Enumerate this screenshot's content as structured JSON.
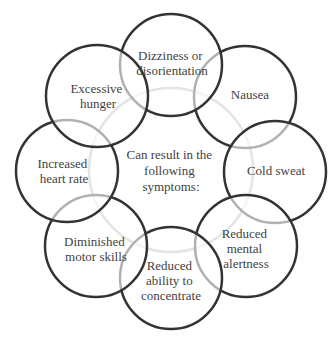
{
  "diagram": {
    "center": {
      "lines": [
        "Can result in the",
        "following",
        "symptoms:"
      ]
    },
    "nodes": [
      {
        "id": "nausea",
        "lines": [
          "Nausea"
        ]
      },
      {
        "id": "cold-sweat",
        "lines": [
          "Cold sweat"
        ]
      },
      {
        "id": "reduced-mental-alertness",
        "lines": [
          "Reduced",
          "mental",
          "alertness"
        ]
      },
      {
        "id": "reduced-ability-to-concentrate",
        "lines": [
          "Reduced",
          "ability to",
          "concentrate"
        ]
      },
      {
        "id": "diminished-motor-skills",
        "lines": [
          "Diminished",
          "motor skills"
        ]
      },
      {
        "id": "increased-heart-rate",
        "lines": [
          "Increased",
          "heart rate"
        ]
      },
      {
        "id": "dizziness-or-disorientation",
        "lines": [
          "Dizziness or",
          "disorientation"
        ]
      },
      {
        "id": "excessive-hunger",
        "lines": [
          "Excessive",
          "hunger"
        ]
      }
    ],
    "colors": {
      "outer_stroke": "#333333",
      "inner_stroke": "#b9b9b9",
      "text": "#3f3f3f",
      "background": "#ffffff"
    }
  }
}
